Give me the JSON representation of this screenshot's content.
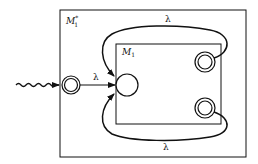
{
  "diagram": {
    "outer_machine": {
      "name": "M",
      "subscript": "1",
      "superscript": "*"
    },
    "inner_machine": {
      "name": "M",
      "subscript": "1"
    },
    "transitions": [
      {
        "from": "new-start",
        "to": "m1-start",
        "label": "λ"
      },
      {
        "from": "m1-accept-top",
        "to": "m1-start",
        "label": "λ"
      },
      {
        "from": "m1-accept-bottom",
        "to": "m1-start",
        "label": "λ"
      }
    ],
    "states": [
      {
        "id": "new-start",
        "type": "accepting",
        "role": "start"
      },
      {
        "id": "m1-start",
        "type": "normal"
      },
      {
        "id": "m1-accept-top",
        "type": "accepting"
      },
      {
        "id": "m1-accept-bottom",
        "type": "accepting"
      }
    ],
    "colors": {
      "stroke": "#111111",
      "background": "#ffffff"
    }
  }
}
